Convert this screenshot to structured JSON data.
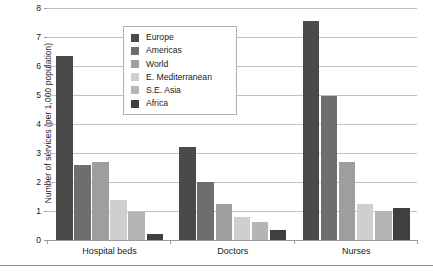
{
  "chart_data": {
    "type": "bar",
    "title": "",
    "subtitle": "",
    "xlabel": "",
    "ylabel": "Number of services (per 1,000 population)",
    "ylim": [
      0,
      8
    ],
    "yticks": [
      0,
      1,
      2,
      3,
      4,
      5,
      6,
      7,
      8
    ],
    "ytick_labels": [
      "0",
      "1",
      "2",
      "3",
      "4",
      "5",
      "6",
      "7",
      "8"
    ],
    "grid": "horizontal",
    "legend_position": "upper-left-inside",
    "categories": [
      "Hospital beds",
      "Doctors",
      "Nurses"
    ],
    "series": [
      {
        "name": "Europe",
        "color": "#4a4a4a",
        "values": [
          6.35,
          3.2,
          7.55
        ]
      },
      {
        "name": "Americas",
        "color": "#6e6e6e",
        "values": [
          2.6,
          2.0,
          4.95
        ]
      },
      {
        "name": "World",
        "color": "#9e9e9e",
        "values": [
          2.7,
          1.25,
          2.7
        ]
      },
      {
        "name": "E. Mediterranean",
        "color": "#cfcfcf",
        "values": [
          1.38,
          0.8,
          1.25
        ]
      },
      {
        "name": "S.E. Asia",
        "color": "#b5b5b5",
        "values": [
          0.95,
          0.62,
          1.0
        ]
      },
      {
        "name": "Africa",
        "color": "#3f3f3f",
        "values": [
          0.2,
          0.33,
          1.1
        ]
      }
    ]
  },
  "legend": {
    "items": [
      {
        "label": "Europe"
      },
      {
        "label": "Americas"
      },
      {
        "label": "World"
      },
      {
        "label": "E. Mediterranean"
      },
      {
        "label": "S.E. Asia"
      },
      {
        "label": "Africa"
      }
    ]
  }
}
